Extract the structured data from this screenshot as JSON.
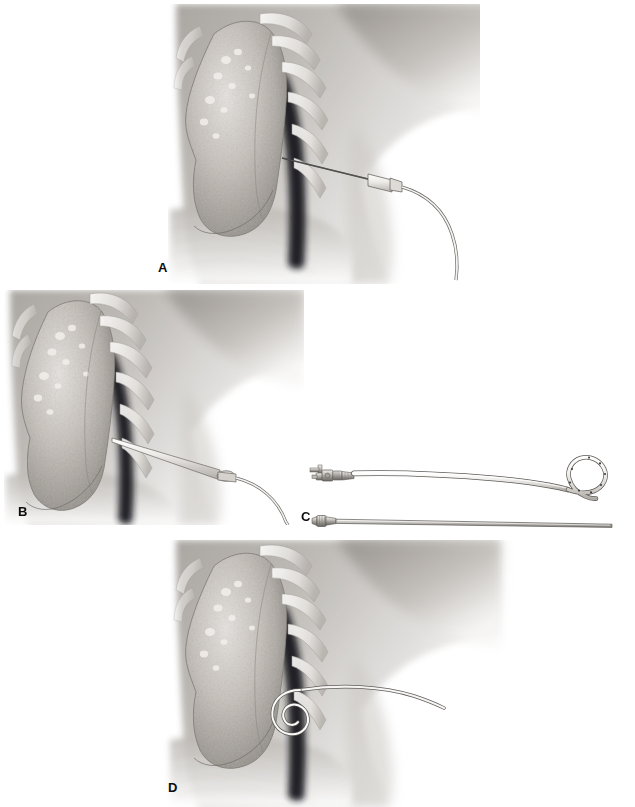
{
  "figure": {
    "background_color": "#ffffff",
    "width": 635,
    "height": 807,
    "style": "grayscale airbrush medical illustration",
    "label_color": "#0d0d0d"
  },
  "panels": [
    {
      "id": "A",
      "label": "A",
      "caption": "Needle inserted into pleural space with guidewire advanced",
      "anatomy": [
        "collapsed lung with apical blebs",
        "ribs over chest wall",
        "dark pneumothorax space",
        "axilla and shoulder soft tissue",
        "diaphragm"
      ],
      "instrument": "introducer-needle-with-guidewire"
    },
    {
      "id": "B",
      "label": "B",
      "caption": "Dilator and sheath advanced over the guidewire",
      "anatomy": [
        "collapsed lung with apical blebs",
        "ribs over chest wall",
        "dark pneumothorax space",
        "axilla and shoulder soft tissue",
        "diaphragm"
      ],
      "instrument": "dilator-over-guidewire"
    },
    {
      "id": "C",
      "label": "C",
      "caption": "Pigtail catheter with stopcock hub and side holes, shown above its straight stiffening stylet",
      "devices": [
        {
          "name": "pigtail-catheter",
          "features": [
            "three-way stopcock hub",
            "luer connector",
            "strain relief",
            "flexible shaft",
            "pigtail loop tip",
            "side drainage holes"
          ],
          "side_hole_count": 8
        },
        {
          "name": "stiffening-stylet",
          "features": [
            "luer hub",
            "rigid straight cannula"
          ]
        }
      ]
    },
    {
      "id": "D",
      "label": "D",
      "caption": "Pigtail catheter coiled within the pleural space after stylet removal",
      "anatomy": [
        "collapsed lung with apical blebs",
        "ribs over chest wall",
        "dark pneumothorax space",
        "axilla and shoulder soft tissue",
        "diaphragm"
      ],
      "instrument": "coiled-pigtail-catheter-in-situ"
    }
  ],
  "colors": {
    "lung_tissue_light": "#d8d4cf",
    "lung_tissue_mid": "#a9a49e",
    "lung_tissue_dark": "#7d7872",
    "pleural_space": "#17171a",
    "rib": "#efece8",
    "soft_tissue": "#b4b0ab",
    "soft_tissue_dark": "#8e8a85",
    "catheter_fill": "#e9e7e4",
    "catheter_outline": "#5d5a56",
    "metal_light": "#d2cfca",
    "metal_dark": "#6e6b67",
    "label_text": "#0d0d0d"
  }
}
